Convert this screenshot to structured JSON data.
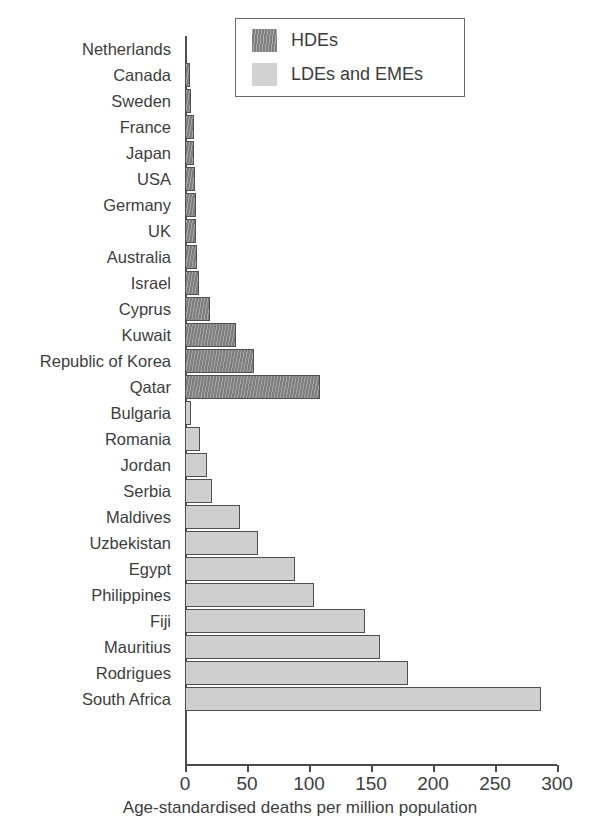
{
  "chart_data": {
    "type": "bar",
    "orientation": "horizontal",
    "title": "",
    "xlabel": "Age-standardised deaths per million population",
    "ylabel": "",
    "xlim": [
      0,
      300
    ],
    "xticks": [
      0,
      50,
      100,
      150,
      200,
      250,
      300
    ],
    "xtick_labels": [
      "0",
      "50",
      "100",
      "150",
      "200",
      "250",
      "300"
    ],
    "grid": false,
    "legend_position": "top-right",
    "categories": [
      "Netherlands",
      "Canada",
      "Sweden",
      "France",
      "Japan",
      "USA",
      "Germany",
      "UK",
      "Australia",
      "Israel",
      "Cyprus",
      "Kuwait",
      "Republic of Korea",
      "Qatar",
      "Bulgaria",
      "Romania",
      "Jordan",
      "Serbia",
      "Maldives",
      "Uzbekistan",
      "Egypt",
      "Philippines",
      "Fiji",
      "Mauritius",
      "Rodrigues",
      "South Africa"
    ],
    "values": [
      2,
      4,
      5,
      7,
      7,
      8,
      9,
      9,
      10,
      11,
      20,
      41,
      56,
      109,
      5,
      12,
      18,
      22,
      44,
      59,
      89,
      104,
      145,
      157,
      180,
      287
    ],
    "groups": [
      "HDEs",
      "HDEs",
      "HDEs",
      "HDEs",
      "HDEs",
      "HDEs",
      "HDEs",
      "HDEs",
      "HDEs",
      "HDEs",
      "HDEs",
      "HDEs",
      "HDEs",
      "HDEs",
      "LDEs and EMEs",
      "LDEs and EMEs",
      "LDEs and EMEs",
      "LDEs and EMEs",
      "LDEs and EMEs",
      "LDEs and EMEs",
      "LDEs and EMEs",
      "LDEs and EMEs",
      "LDEs and EMEs",
      "LDEs and EMEs",
      "LDEs and EMEs",
      "LDEs and EMEs"
    ],
    "series": [
      {
        "name": "HDEs",
        "color": "#7e7e7e",
        "pattern": "vertical-hatch",
        "points": [
          {
            "category": "Netherlands",
            "value": 2
          },
          {
            "category": "Canada",
            "value": 4
          },
          {
            "category": "Sweden",
            "value": 5
          },
          {
            "category": "France",
            "value": 7
          },
          {
            "category": "Japan",
            "value": 7
          },
          {
            "category": "USA",
            "value": 8
          },
          {
            "category": "Germany",
            "value": 9
          },
          {
            "category": "UK",
            "value": 9
          },
          {
            "category": "Australia",
            "value": 10
          },
          {
            "category": "Israel",
            "value": 11
          },
          {
            "category": "Cyprus",
            "value": 20
          },
          {
            "category": "Kuwait",
            "value": 41
          },
          {
            "category": "Republic of Korea",
            "value": 56
          },
          {
            "category": "Qatar",
            "value": 109
          }
        ]
      },
      {
        "name": "LDEs and EMEs",
        "color": "#cfcfcf",
        "pattern": "solid",
        "points": [
          {
            "category": "Bulgaria",
            "value": 5
          },
          {
            "category": "Romania",
            "value": 12
          },
          {
            "category": "Jordan",
            "value": 18
          },
          {
            "category": "Serbia",
            "value": 22
          },
          {
            "category": "Maldives",
            "value": 44
          },
          {
            "category": "Uzbekistan",
            "value": 59
          },
          {
            "category": "Egypt",
            "value": 89
          },
          {
            "category": "Philippines",
            "value": 104
          },
          {
            "category": "Fiji",
            "value": 145
          },
          {
            "category": "Mauritius",
            "value": 157
          },
          {
            "category": "Rodrigues",
            "value": 180
          },
          {
            "category": "South Africa",
            "value": 287
          }
        ]
      }
    ]
  },
  "legend": {
    "entries": [
      {
        "label": "HDEs",
        "style": "hde"
      },
      {
        "label": "LDEs and EMEs",
        "style": "lde"
      }
    ]
  },
  "axis": {
    "x_title": "Age-standardised deaths per million population"
  },
  "colors": {
    "hde": "#7e7e7e",
    "lde": "#cfcfcf",
    "axis": "#4a4a4a",
    "text": "#3d3d3d",
    "background": "#ffffff"
  }
}
